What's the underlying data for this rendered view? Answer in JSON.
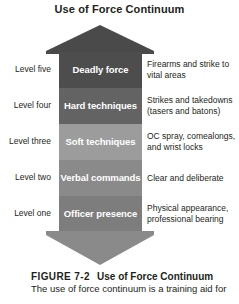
{
  "figure": {
    "title": "Use of Force Continuum"
  },
  "colors": {
    "arrow_head": "#4a4a4a",
    "arrow_tail": "#8a8a8a",
    "text": "#231f20",
    "band_text": "#ffffff"
  },
  "diagram": {
    "type": "arrow-continuum",
    "levels": [
      {
        "level_label": "Level five",
        "band_label": "Deadly force",
        "description": "Firearms and strike to vital areas",
        "color": "#4d4d4d"
      },
      {
        "level_label": "Level four",
        "band_label": "Hard techniques",
        "description": "Strikes and takedowns (tasers and batons)",
        "color": "#636363"
      },
      {
        "level_label": "Level three",
        "band_label": "Soft techniques",
        "description": "OC spray, comealongs, and wrist locks",
        "color": "#9c9c9c"
      },
      {
        "level_label": "Level two",
        "band_label": "Verbal commands",
        "description": "Clear and deliberate",
        "color": "#8a8a8a"
      },
      {
        "level_label": "Level one",
        "band_label": "Officer presence",
        "description": "Physical appearance, professional bearing",
        "color": "#7d7d7d"
      }
    ]
  },
  "caption": {
    "figure_number": "FIGURE 7-2",
    "figure_name": "Use of Force Continuum",
    "body": "The use of force continuum is a training aid for"
  }
}
